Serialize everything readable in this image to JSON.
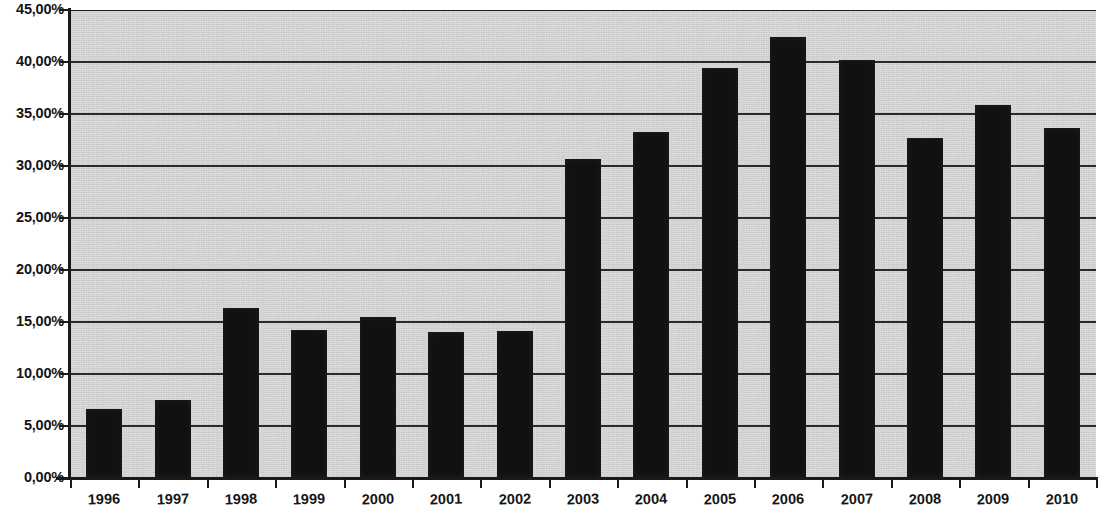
{
  "chart_data": {
    "type": "bar",
    "title": "",
    "subtitle": "",
    "xlabel": "",
    "ylabel": "",
    "categories": [
      "1996",
      "1997",
      "1998",
      "1999",
      "2000",
      "2001",
      "2002",
      "2003",
      "2004",
      "2005",
      "2006",
      "2007",
      "2008",
      "2009",
      "2010"
    ],
    "values": [
      6.6,
      7.5,
      16.3,
      14.2,
      15.5,
      14.0,
      14.1,
      30.7,
      33.3,
      39.4,
      42.4,
      40.2,
      32.7,
      35.9,
      33.7
    ],
    "value_labels": [
      "6,60%",
      "7,50%",
      "16,30%",
      "14,20%",
      "15,50%",
      "14,00%",
      "14,10%",
      "30,70%",
      "33,30%",
      "39,40%",
      "42,40%",
      "40,20%",
      "32,70%",
      "35,90%",
      "33,70%"
    ],
    "ylim": [
      0,
      45
    ],
    "ytick_values": [
      0,
      5,
      10,
      15,
      20,
      25,
      30,
      35,
      40,
      45
    ],
    "ytick_labels": [
      "0,00%",
      "5,00%",
      "10,00%",
      "15,00%",
      "20,00%",
      "25,00%",
      "30,00%",
      "35,00%",
      "40,00%",
      "45,00%"
    ],
    "grid": true,
    "grid_axis": "y",
    "legend": false,
    "legend_position": "none",
    "series": [
      {
        "name": "",
        "values": [
          6.6,
          7.5,
          16.3,
          14.2,
          15.5,
          14.0,
          14.1,
          30.7,
          33.3,
          39.4,
          42.4,
          40.2,
          32.7,
          35.9,
          33.7
        ]
      }
    ],
    "colors": {
      "bar": "#111111",
      "plot_background": "#d4d4d4",
      "gridline": "#2a2a2a",
      "axis": "#1a1a1a",
      "tick_label": "#141414",
      "page_background": "#ffffff"
    }
  }
}
